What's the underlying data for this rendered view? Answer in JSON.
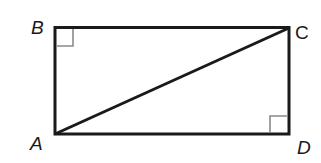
{
  "diagram": {
    "type": "rectangle-with-diagonal",
    "vertices": [
      {
        "id": "A",
        "label": "A",
        "x": 55,
        "y": 134,
        "lx": 30,
        "ly": 150
      },
      {
        "id": "B",
        "label": "B",
        "x": 55,
        "y": 27,
        "lx": 31,
        "ly": 33
      },
      {
        "id": "C",
        "label": "C",
        "x": 289,
        "y": 28,
        "lx": 295,
        "ly": 38
      },
      {
        "id": "D",
        "label": "D",
        "x": 289,
        "y": 134,
        "lx": 295,
        "ly": 154
      }
    ],
    "edges": [
      [
        "A",
        "B"
      ],
      [
        "B",
        "C"
      ],
      [
        "C",
        "D"
      ],
      [
        "D",
        "A"
      ]
    ],
    "diagonal": [
      "A",
      "C"
    ],
    "right_angle_marks": [
      "B",
      "D"
    ],
    "colors": {
      "stroke": "#1a1a1a",
      "mark": "#8a8a8a",
      "background": "#ffffff"
    }
  }
}
